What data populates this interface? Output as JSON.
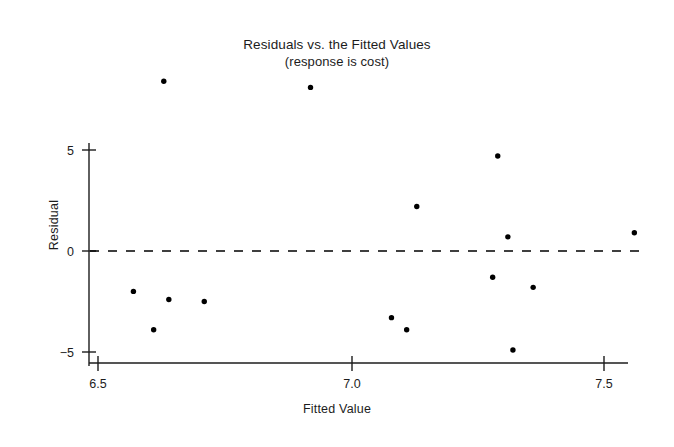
{
  "chart_data": {
    "type": "scatter",
    "title": "Residuals vs. the Fitted Values",
    "subtitle": "(response is cost)",
    "xlabel": "Fitted Value",
    "ylabel": "Residual",
    "xlim": [
      6.5,
      7.56
    ],
    "ylim": [
      -5.4,
      9.0
    ],
    "xticks": [
      6.5,
      7.0,
      7.5
    ],
    "xticklabels": [
      "6.5",
      "7.0",
      "7.5"
    ],
    "yticks": [
      5,
      0,
      -5
    ],
    "yticklabels": [
      "5",
      "0",
      "−5"
    ],
    "grid": false,
    "legend": null,
    "marker_color": "#000000",
    "marker_size": 5.4,
    "reference_line": {
      "orientation": "horizontal",
      "value": 0,
      "style": "dashed",
      "color": "#000000"
    },
    "x": [
      6.63,
      6.57,
      6.61,
      6.64,
      6.71,
      6.92,
      7.08,
      7.11,
      7.13,
      7.28,
      7.29,
      7.31,
      7.32,
      7.36,
      7.56
    ],
    "y": [
      8.4,
      -2.0,
      -3.9,
      -2.4,
      -2.5,
      8.1,
      -3.3,
      -3.9,
      2.2,
      -1.3,
      4.7,
      0.7,
      -4.9,
      -1.8,
      0.9
    ],
    "points": [
      {
        "x": 6.63,
        "y": 8.4
      },
      {
        "x": 6.57,
        "y": -2.0
      },
      {
        "x": 6.61,
        "y": -3.9
      },
      {
        "x": 6.64,
        "y": -2.4
      },
      {
        "x": 6.71,
        "y": -2.5
      },
      {
        "x": 6.92,
        "y": 8.1
      },
      {
        "x": 7.08,
        "y": -3.3
      },
      {
        "x": 7.11,
        "y": -3.9
      },
      {
        "x": 7.13,
        "y": 2.2
      },
      {
        "x": 7.28,
        "y": -1.3
      },
      {
        "x": 7.29,
        "y": 4.7
      },
      {
        "x": 7.31,
        "y": 0.7
      },
      {
        "x": 7.32,
        "y": -4.9
      },
      {
        "x": 7.36,
        "y": -1.8
      },
      {
        "x": 7.56,
        "y": 0.9
      }
    ]
  },
  "chart": {
    "title": "Residuals vs. the Fitted Values",
    "subtitle": "(response is cost)",
    "xlabel": "Fitted Value",
    "ylabel": "Residual",
    "xticklabels": [
      "6.5",
      "7.0",
      "7.5"
    ],
    "yticklabels": [
      "5",
      "0",
      "−5"
    ]
  }
}
